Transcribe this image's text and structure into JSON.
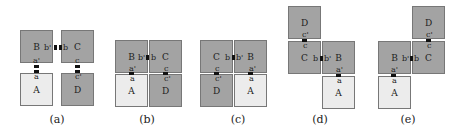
{
  "colors": {
    "dark_tile": "#a3a3a3",
    "light_tile": "#ececec",
    "border": "#777777",
    "port": "#111111"
  },
  "panels": [
    {
      "caption": "(a)",
      "tiles": {
        "B": "B",
        "C": "C",
        "A": "A",
        "D": "D"
      },
      "ports": {
        "b1": "b'",
        "b2": "b",
        "a1": "a'",
        "a2": "a",
        "c1": "c",
        "c2": "c'"
      }
    },
    {
      "caption": "(b)",
      "tiles": {
        "B": "B",
        "C": "C",
        "A": "A",
        "D": "D"
      },
      "ports": {
        "b1": "b'",
        "b2": "b",
        "a1": "a'",
        "a2": "a",
        "c1": "c",
        "c2": "c'"
      }
    },
    {
      "caption": "(c)",
      "tiles": {
        "C": "C",
        "B": "B",
        "D": "D",
        "A": "A"
      },
      "ports": {
        "b1": "b",
        "b2": "b'",
        "c1": "c",
        "c2": "c'",
        "a1": "a'",
        "a2": "a"
      }
    },
    {
      "caption": "(d)",
      "tiles": {
        "D": "D",
        "C": "C",
        "B": "B",
        "A": "A"
      },
      "ports": {
        "c1": "c'",
        "c2": "c",
        "b1": "b",
        "b2": "b'",
        "a1": "a'",
        "a2": "a"
      }
    },
    {
      "caption": "(e)",
      "tiles": {
        "D": "D",
        "B": "B",
        "C": "C",
        "A": "A"
      },
      "ports": {
        "c1": "c'",
        "c2": "c",
        "b1": "b'",
        "b2": "b",
        "a1": "a'",
        "a2": "a"
      }
    }
  ]
}
